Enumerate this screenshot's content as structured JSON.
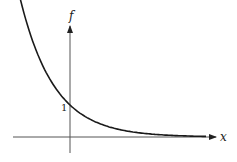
{
  "chart_data": {
    "type": "line",
    "title": "",
    "function": "f(x) = e^(-x)",
    "xlabel": "x",
    "ylabel": "f",
    "annotations": [
      {
        "text": "1",
        "at": "y-intercept",
        "x": 0,
        "y": 1
      }
    ],
    "series": [
      {
        "name": "f",
        "x": [
          -1.6,
          -1.2,
          -0.8,
          -0.4,
          0,
          0.5,
          1.0,
          1.5,
          2.0,
          2.5,
          3.0,
          3.5,
          4.0
        ],
        "values": [
          4.95,
          3.32,
          2.23,
          1.49,
          1.0,
          0.61,
          0.37,
          0.22,
          0.14,
          0.08,
          0.05,
          0.03,
          0.02
        ]
      }
    ],
    "xlim": [
      -1.7,
      4.3
    ],
    "ylim": [
      -0.5,
      5.0
    ],
    "grid": false,
    "legend": null,
    "tick_labels": {
      "y": [
        "1"
      ],
      "x": []
    },
    "colors": {
      "curve": "#1a1a1a",
      "axes": "#444444"
    }
  },
  "labels": {
    "x_axis": "x",
    "y_axis": "f",
    "intercept": "1"
  }
}
